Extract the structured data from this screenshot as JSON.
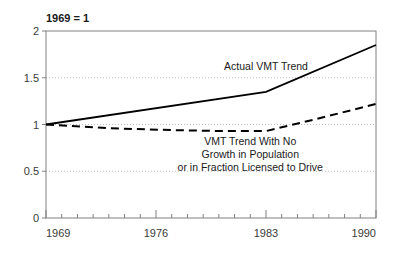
{
  "chart_data": {
    "type": "line",
    "title": "1969 = 1",
    "xlabel": "",
    "ylabel": "",
    "xlim": [
      1969,
      1990
    ],
    "ylim": [
      0,
      2
    ],
    "grid": true,
    "grid_values": [
      0.5,
      1,
      1.5
    ],
    "legend_position": "inline-annotations",
    "yticks": [
      "0",
      "0.5",
      "1",
      "1.5",
      "2"
    ],
    "ytick_values": [
      0,
      0.5,
      1,
      1.5,
      2
    ],
    "xticks": [
      "1969",
      "1976",
      "1983",
      "1990"
    ],
    "xtick_values": [
      1969,
      1976,
      1983,
      1990
    ],
    "minor_xticks": [
      1970,
      1971,
      1972,
      1973,
      1974,
      1975,
      1977,
      1978,
      1979,
      1980,
      1981,
      1982,
      1984,
      1985,
      1986,
      1987,
      1988,
      1989
    ],
    "series": [
      {
        "name": "Actual VMT Trend",
        "style": "solid",
        "color": "#000000",
        "x": [
          1969,
          1983,
          1990
        ],
        "values": [
          1.0,
          1.35,
          1.85
        ]
      },
      {
        "name": "VMT Trend With No Growth in Population or in Fraction Licensed to Drive",
        "style": "dashed",
        "color": "#000000",
        "x": [
          1969,
          1973,
          1977,
          1980,
          1983,
          1986,
          1990
        ],
        "values": [
          1.0,
          0.96,
          0.94,
          0.93,
          0.93,
          1.05,
          1.22
        ]
      }
    ],
    "annotations": [
      {
        "id": "actual-label",
        "lines": [
          "Actual VMT Trend"
        ],
        "x": 1983,
        "y": 1.58
      },
      {
        "id": "no-growth-label",
        "lines": [
          "VMT Trend With No",
          "Growth in Population",
          "or in Fraction Licensed to Drive"
        ],
        "x": 1982,
        "y": 0.78
      }
    ]
  },
  "colors": {
    "line": "#000000",
    "axis": "#808080",
    "grid": "#bdbdbd",
    "text": "#1a1a1a",
    "tick_text": "#3a3a3a",
    "background": "#ffffff"
  }
}
